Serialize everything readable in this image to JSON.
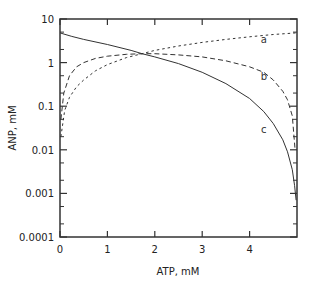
{
  "chart_data": {
    "type": "line",
    "title": "",
    "xlabel": "ATP, mM",
    "ylabel": "ANP, mM",
    "xlim": [
      0,
      5
    ],
    "ylim": [
      0.0001,
      10
    ],
    "yscale": "log",
    "grid": false,
    "legend": null,
    "x_ticks": [
      0,
      1,
      2,
      3,
      4
    ],
    "x_tick_labels": [
      "0",
      "1",
      "2",
      "3",
      "4"
    ],
    "y_ticks": [
      0.0001,
      0.001,
      0.01,
      0.1,
      1,
      10
    ],
    "y_tick_labels": [
      "0.0001",
      "0.001",
      "0.01",
      "0.1",
      "1",
      "10"
    ],
    "annotations": [
      {
        "text": "a",
        "x": 4.3,
        "y": 3.5
      },
      {
        "text": "b",
        "x": 4.3,
        "y": 0.5
      },
      {
        "text": "c",
        "x": 4.3,
        "y": 0.03
      }
    ],
    "series": [
      {
        "name": "a",
        "style": "dotted",
        "x": [
          0.02,
          0.1,
          0.2,
          0.35,
          0.5,
          0.75,
          1.0,
          1.4,
          1.73,
          2.0,
          2.5,
          3.0,
          3.5,
          4.0,
          4.5,
          4.98
        ],
        "values": [
          0.02,
          0.08,
          0.16,
          0.28,
          0.4,
          0.65,
          0.9,
          1.3,
          1.6,
          1.9,
          2.4,
          2.9,
          3.4,
          3.9,
          4.4,
          4.8
        ]
      },
      {
        "name": "b",
        "style": "dashed",
        "x": [
          0.02,
          0.08,
          0.2,
          0.35,
          0.5,
          0.75,
          1.0,
          1.4,
          1.73,
          2.0,
          2.5,
          3.0,
          3.5,
          4.0,
          4.3,
          4.5,
          4.7,
          4.8,
          4.9,
          4.96
        ],
        "values": [
          0.05,
          0.2,
          0.5,
          0.8,
          1.0,
          1.25,
          1.4,
          1.55,
          1.6,
          1.6,
          1.5,
          1.35,
          1.1,
          0.8,
          0.6,
          0.4,
          0.22,
          0.14,
          0.06,
          0.01
        ]
      },
      {
        "name": "c",
        "style": "solid",
        "x": [
          0.0,
          0.25,
          0.5,
          1.0,
          1.5,
          1.73,
          2.0,
          2.5,
          3.0,
          3.5,
          4.0,
          4.3,
          4.5,
          4.7,
          4.8,
          4.9,
          4.95,
          4.98
        ],
        "values": [
          4.8,
          4.0,
          3.4,
          2.6,
          1.9,
          1.6,
          1.35,
          0.95,
          0.6,
          0.33,
          0.15,
          0.075,
          0.04,
          0.017,
          0.009,
          0.0035,
          0.0015,
          0.0007
        ]
      }
    ]
  }
}
